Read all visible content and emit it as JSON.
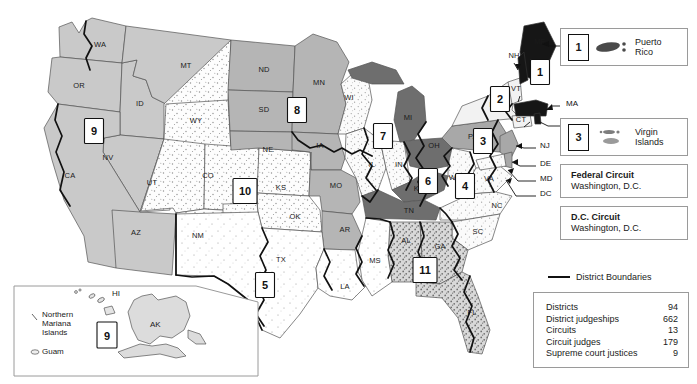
{
  "map": {
    "title": "United States Courts of Appeals and District Courts",
    "states": [
      {
        "abbr": "WA",
        "x": 100,
        "y": 47
      },
      {
        "abbr": "OR",
        "x": 79,
        "y": 88
      },
      {
        "abbr": "ID",
        "x": 140,
        "y": 106
      },
      {
        "abbr": "MT",
        "x": 186,
        "y": 68
      },
      {
        "abbr": "ND",
        "x": 264,
        "y": 72
      },
      {
        "abbr": "SD",
        "x": 264,
        "y": 112
      },
      {
        "abbr": "NE",
        "x": 268,
        "y": 152
      },
      {
        "abbr": "MN",
        "x": 319,
        "y": 85
      },
      {
        "abbr": "IA",
        "x": 320,
        "y": 148
      },
      {
        "abbr": "WI",
        "x": 349,
        "y": 100
      },
      {
        "abbr": "MI",
        "x": 408,
        "y": 120
      },
      {
        "abbr": "IL",
        "x": 372,
        "y": 167
      },
      {
        "abbr": "IN",
        "x": 399,
        "y": 167
      },
      {
        "abbr": "OH",
        "x": 434,
        "y": 148
      },
      {
        "abbr": "PA",
        "x": 473,
        "y": 139
      },
      {
        "abbr": "NY",
        "x": 495,
        "y": 107
      },
      {
        "abbr": "VT",
        "x": 516,
        "y": 91
      },
      {
        "abbr": "NH",
        "x": 514,
        "y": 58
      },
      {
        "abbr": "ME",
        "x": 540,
        "y": 44
      },
      {
        "abbr": "CT",
        "x": 521,
        "y": 122
      },
      {
        "abbr": "WV",
        "x": 455,
        "y": 180
      },
      {
        "abbr": "VA",
        "x": 489,
        "y": 181
      },
      {
        "abbr": "KY",
        "x": 419,
        "y": 191
      },
      {
        "abbr": "TN",
        "x": 409,
        "y": 213
      },
      {
        "abbr": "NC",
        "x": 497,
        "y": 208
      },
      {
        "abbr": "SC",
        "x": 478,
        "y": 234
      },
      {
        "abbr": "GA",
        "x": 440,
        "y": 249
      },
      {
        "abbr": "FL",
        "x": 472,
        "y": 315
      },
      {
        "abbr": "AL",
        "x": 406,
        "y": 243
      },
      {
        "abbr": "MS",
        "x": 375,
        "y": 263
      },
      {
        "abbr": "LA",
        "x": 345,
        "y": 289
      },
      {
        "abbr": "AR",
        "x": 345,
        "y": 232
      },
      {
        "abbr": "MO",
        "x": 336,
        "y": 188
      },
      {
        "abbr": "KS",
        "x": 281,
        "y": 190
      },
      {
        "abbr": "OK",
        "x": 295,
        "y": 219
      },
      {
        "abbr": "TX",
        "x": 281,
        "y": 262
      },
      {
        "abbr": "NM",
        "x": 198,
        "y": 238
      },
      {
        "abbr": "CO",
        "x": 208,
        "y": 178
      },
      {
        "abbr": "UT",
        "x": 152,
        "y": 185
      },
      {
        "abbr": "WY",
        "x": 196,
        "y": 123
      },
      {
        "abbr": "NV",
        "x": 108,
        "y": 160
      },
      {
        "abbr": "CA",
        "x": 70,
        "y": 178
      },
      {
        "abbr": "AZ",
        "x": 136,
        "y": 235
      },
      {
        "abbr": "AK",
        "x": 158,
        "y": 325
      },
      {
        "abbr": "HI",
        "x": 117,
        "y": 294
      }
    ],
    "circuit_badges": [
      {
        "n": "1",
        "x": 540,
        "y": 72
      },
      {
        "n": "2",
        "x": 500,
        "y": 99
      },
      {
        "n": "3",
        "x": 483,
        "y": 141
      },
      {
        "n": "4",
        "x": 465,
        "y": 186
      },
      {
        "n": "5",
        "x": 265,
        "y": 285
      },
      {
        "n": "6",
        "x": 428,
        "y": 181
      },
      {
        "n": "7",
        "x": 383,
        "y": 136
      },
      {
        "n": "8",
        "x": 297,
        "y": 110
      },
      {
        "n": "9",
        "x": 94,
        "y": 131
      },
      {
        "n": "10",
        "x": 245,
        "y": 191
      },
      {
        "n": "11",
        "x": 425,
        "y": 270
      }
    ],
    "pointer_labels": [
      {
        "text": "ME",
        "x": 566,
        "y": 46
      },
      {
        "text": "MA",
        "x": 566,
        "y": 106
      },
      {
        "text": "RI",
        "x": 566,
        "y": 126
      },
      {
        "text": "NJ",
        "x": 540,
        "y": 148
      },
      {
        "text": "DE",
        "x": 540,
        "y": 166
      },
      {
        "text": "MD",
        "x": 540,
        "y": 181
      },
      {
        "text": "DC",
        "x": 540,
        "y": 196
      },
      {
        "text": "NH",
        "x": 514,
        "y": 58
      },
      {
        "text": "VT",
        "x": 516,
        "y": 91
      },
      {
        "text": "CT",
        "x": 521,
        "y": 122
      }
    ]
  },
  "territory_panels": [
    {
      "badge": "1",
      "name": "Puerto\nRico",
      "name_line1": "Puerto",
      "name_line2": "Rico"
    },
    {
      "badge": "3",
      "name": "Virgin\nIslands",
      "name_line1": "Virgin",
      "name_line2": "Islands"
    }
  ],
  "court_panels": [
    {
      "title": "Federal Circuit",
      "sub": "Washington, D.C."
    },
    {
      "title": "D.C. Circuit",
      "sub": "Washington, D.C."
    }
  ],
  "legend": {
    "district_boundaries_label": "District Boundaries"
  },
  "stats": {
    "rows": [
      {
        "label": "Districts",
        "value": "94"
      },
      {
        "label": "District judgeships",
        "value": "662"
      },
      {
        "label": "Circuits",
        "value": "13"
      },
      {
        "label": "Circuit judges",
        "value": "179"
      },
      {
        "label": "Supreme court justices",
        "value": "9"
      }
    ]
  },
  "inset": {
    "hawaii_label": "HI",
    "alaska_label": "AK",
    "northern_mariana_line1": "Northern",
    "northern_mariana_line2": "Mariana",
    "northern_mariana_line3": "Islands",
    "guam_label": "Guam",
    "circuit_badge": "9"
  },
  "colors": {
    "circuit1": "#161616",
    "circuit2": "#f2f2f2",
    "circuit3": "#a8a8a8",
    "circuit4": "#ededed",
    "circuit5": "#fbfbfb",
    "circuit6": "#6e6e6e",
    "circuit7": "#f0f0f0",
    "circuit8": "#b5b5b5",
    "circuit9": "#c9c9c9",
    "circuit10": "#f7f7f7",
    "circuit11": "#bdbdbd",
    "stroke": "#555555",
    "district_boundary": "#111111"
  }
}
